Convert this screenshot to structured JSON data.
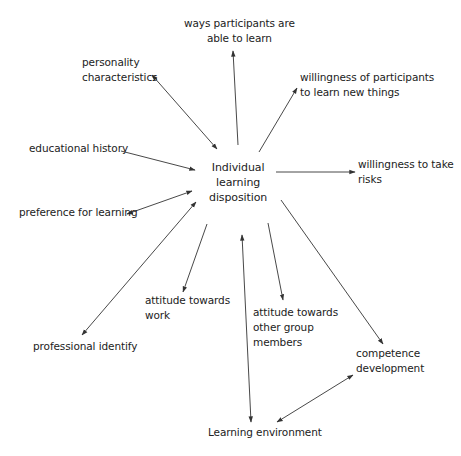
{
  "diagram": {
    "center": {
      "label": "Individual\nlearning\ndisposition"
    },
    "nodes": [
      {
        "id": "ways",
        "label": "ways participants are\nable to learn"
      },
      {
        "id": "personality",
        "label": "personality\ncharacteristics"
      },
      {
        "id": "willingness-new",
        "label": "willingness of participants\nto learn new things"
      },
      {
        "id": "educational-history",
        "label": "educational history"
      },
      {
        "id": "willingness-risks",
        "label": "willingness to take\nrisks"
      },
      {
        "id": "preference",
        "label": "preference for learning"
      },
      {
        "id": "attitude-work",
        "label": "attitude towards\nwork"
      },
      {
        "id": "attitude-group",
        "label": "attitude towards\nother group\nmembers"
      },
      {
        "id": "professional-identify",
        "label": "professional identify"
      },
      {
        "id": "competence",
        "label": "competence\ndevelopment"
      },
      {
        "id": "learning-environment",
        "label": "Learning environment"
      }
    ],
    "edges": [
      {
        "from": "center",
        "to": "ways",
        "direction": "to-node"
      },
      {
        "from": "center",
        "to": "personality",
        "direction": "both"
      },
      {
        "from": "center",
        "to": "willingness-new",
        "direction": "to-node"
      },
      {
        "from": "educational-history",
        "to": "center",
        "direction": "to-center"
      },
      {
        "from": "center",
        "to": "willingness-risks",
        "direction": "to-node"
      },
      {
        "from": "center",
        "to": "preference",
        "direction": "both"
      },
      {
        "from": "center",
        "to": "attitude-work",
        "direction": "to-node"
      },
      {
        "from": "center",
        "to": "attitude-group",
        "direction": "to-node"
      },
      {
        "from": "center",
        "to": "professional-identify",
        "direction": "both"
      },
      {
        "from": "center",
        "to": "competence",
        "direction": "to-node"
      },
      {
        "from": "center",
        "to": "learning-environment",
        "direction": "both"
      },
      {
        "from": "learning-environment",
        "to": "competence",
        "direction": "both"
      }
    ],
    "colors": {
      "line": "#333333",
      "text": "#222222",
      "background": "#ffffff"
    }
  }
}
